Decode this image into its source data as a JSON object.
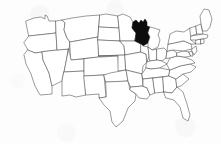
{
  "figure": {
    "width": 221,
    "height": 144,
    "background_color": "#fdfdfd",
    "border_color": "#4a4a4a",
    "state_fill_color": "#ffffff",
    "highlight_color": "#0d0d0d"
  },
  "highlighted": {
    "name": "Wisconsin",
    "abbr": "WI",
    "fill": "#0d0d0d"
  },
  "legend": {
    "visible": false,
    "items": []
  },
  "labels": {
    "visible": false,
    "items": []
  },
  "states": [
    {
      "abbr": "WA",
      "name": "Washington",
      "highlight": false,
      "d": "M26,21 L34,18 L41,17 L45,19 L45,15 L47,16 L49,21 L56,21 L56,33 L29,36 Z"
    },
    {
      "abbr": "OR",
      "name": "Oregon",
      "highlight": false,
      "d": "M29,36 L56,33 L57,50 L35,53 L28,50 L24,43 Z"
    },
    {
      "abbr": "CA",
      "name": "California",
      "highlight": false,
      "d": "M28,50 L35,53 L42,52 L43,60 L49,73 L52,86 L52,94 L40,95 L35,86 L31,74 L26,64 L24,55 Z"
    },
    {
      "abbr": "NV",
      "name": "Nevada",
      "highlight": false,
      "d": "M57,50 L68,49 L67,57 L64,72 L62,81 L52,86 L49,73 L43,60 L42,52 Z"
    },
    {
      "abbr": "ID",
      "name": "Idaho",
      "highlight": false,
      "d": "M56,21 L62,20 L65,23 L64,30 L67,38 L70,42 L69,49 L57,50 L56,33 Z"
    },
    {
      "abbr": "MT",
      "name": "Montana",
      "highlight": false,
      "d": "M62,20 L72,18 L86,16 L100,15 L99,25 L98,37 L70,42 L67,38 L64,30 L65,23 Z"
    },
    {
      "abbr": "WY",
      "name": "Wyoming",
      "highlight": false,
      "d": "M70,42 L98,37 L99,57 L71,60 Z"
    },
    {
      "abbr": "UT",
      "name": "Utah",
      "highlight": false,
      "d": "M69,49 L71,60 L84,59 L84,71 L64,72 L67,57 Z"
    },
    {
      "abbr": "AZ",
      "name": "Arizona",
      "highlight": false,
      "d": "M64,72 L84,71 L86,95 L76,97 L70,95 L62,96 L62,81 Z"
    },
    {
      "abbr": "CO",
      "name": "Colorado",
      "highlight": false,
      "d": "M99,57 L101,57 L118,56 L119,74 L84,76 L84,59 Z"
    },
    {
      "abbr": "NM",
      "name": "New Mexico",
      "highlight": false,
      "d": "M84,76 L104,75 L106,97 L99,98 L99,94 L86,95 Z"
    },
    {
      "abbr": "ND",
      "name": "North Dakota",
      "highlight": false,
      "d": "M100,15 L106,14 L118,16 L119,28 L99,27 Z"
    },
    {
      "abbr": "SD",
      "name": "South Dakota",
      "highlight": false,
      "d": "M99,27 L119,28 L120,41 L98,40 Z"
    },
    {
      "abbr": "NE",
      "name": "Nebraska",
      "highlight": false,
      "d": "M98,40 L120,41 L124,46 L125,55 L99,56 Z"
    },
    {
      "abbr": "KS",
      "name": "Kansas",
      "highlight": false,
      "d": "M99,56 L125,55 L126,70 L118,71 L118,56 Z"
    },
    {
      "abbr": "OK",
      "name": "Oklahoma",
      "highlight": false,
      "d": "M104,75 L110,73 L126,70 L128,81 L113,82 L106,82 Z"
    },
    {
      "abbr": "TX",
      "name": "Texas",
      "highlight": false,
      "d": "M106,82 L128,81 L130,90 L136,94 L135,101 L128,108 L123,121 L116,127 L112,122 L110,111 L104,105 L99,98 L106,97 Z"
    },
    {
      "abbr": "MN",
      "name": "Minnesota",
      "highlight": false,
      "d": "M118,16 L123,14 L130,17 L133,22 L132,28 L136,33 L135,41 L120,41 L119,28 Z"
    },
    {
      "abbr": "IA",
      "name": "Iowa",
      "highlight": false,
      "d": "M120,41 L135,41 L141,44 L141,52 L125,55 L124,46 Z"
    },
    {
      "abbr": "MO",
      "name": "Missouri",
      "highlight": false,
      "d": "M125,55 L141,52 L146,54 L147,62 L143,66 L142,74 L126,70 Z"
    },
    {
      "abbr": "AR",
      "name": "Arkansas",
      "highlight": false,
      "d": "M128,81 L126,70 L142,74 L143,86 L131,87 Z"
    },
    {
      "abbr": "LA",
      "name": "Louisiana",
      "highlight": false,
      "d": "M131,87 L143,86 L147,88 L150,95 L147,99 L139,98 L136,94 L130,90 Z"
    },
    {
      "abbr": "WI",
      "name": "Wisconsin",
      "highlight": true,
      "d": "M136,33 L132,28 L133,22 L136,20 L139,23 L141,20 L143,22 L145,19 L147,22 L147,26 L150,27 L148,33 L150,37 L148,43 L143,46 L141,44 L135,41 Z"
    },
    {
      "abbr": "IL",
      "name": "Illinois",
      "highlight": false,
      "d": "M141,44 L143,46 L148,47 L149,56 L147,62 L146,54 L141,52 Z"
    },
    {
      "abbr": "MI",
      "name": "Michigan",
      "highlight": false,
      "d": "M150,27 L154,28 L160,30 L158,35 L160,40 L158,47 L152,50 L148,47 L148,43 L150,37 L148,33 Z"
    },
    {
      "abbr": "IN",
      "name": "Indiana",
      "highlight": false,
      "d": "M149,56 L148,47 L152,50 L157,49 L157,60 L150,61 Z"
    },
    {
      "abbr": "OH",
      "name": "Ohio",
      "highlight": false,
      "d": "M157,49 L164,48 L167,51 L166,58 L162,61 L157,60 Z"
    },
    {
      "abbr": "KY",
      "name": "Kentucky",
      "highlight": false,
      "d": "M147,62 L150,61 L157,60 L162,61 L167,64 L160,68 L151,69 L146,68 Z"
    },
    {
      "abbr": "TN",
      "name": "Tennessee",
      "highlight": false,
      "d": "M142,74 L146,68 L151,69 L160,68 L170,70 L169,76 L143,79 Z"
    },
    {
      "abbr": "MS",
      "name": "Mississippi",
      "highlight": false,
      "d": "M143,86 L143,79 L153,78 L155,93 L150,95 L147,88 Z"
    },
    {
      "abbr": "AL",
      "name": "Alabama",
      "highlight": false,
      "d": "M153,78 L163,77 L164,92 L155,93 Z"
    },
    {
      "abbr": "GA",
      "name": "Georgia",
      "highlight": false,
      "d": "M163,77 L169,76 L176,79 L177,87 L172,93 L164,92 Z"
    },
    {
      "abbr": "FL",
      "name": "Florida",
      "highlight": false,
      "d": "M164,92 L172,93 L177,87 L183,92 L187,104 L190,115 L188,121 L183,118 L180,107 L174,100 L166,98 Z"
    },
    {
      "abbr": "SC",
      "name": "South Carolina",
      "highlight": false,
      "d": "M176,79 L183,74 L189,79 L181,86 L177,87 Z"
    },
    {
      "abbr": "NC",
      "name": "North Carolina",
      "highlight": false,
      "d": "M170,70 L180,66 L190,64 L196,67 L191,72 L183,74 L176,79 L169,76 Z"
    },
    {
      "abbr": "VA",
      "name": "Virginia",
      "highlight": false,
      "d": "M167,64 L170,58 L177,56 L184,57 L192,60 L195,63 L190,64 L180,66 L170,70 Z"
    },
    {
      "abbr": "WV",
      "name": "West Virginia",
      "highlight": false,
      "d": "M166,58 L167,51 L173,50 L177,53 L177,56 L170,58 Z"
    },
    {
      "abbr": "MD",
      "name": "Maryland",
      "highlight": false,
      "d": "M177,53 L183,51 L189,52 L191,56 L186,57 L184,57 L177,56 Z"
    },
    {
      "abbr": "DE",
      "name": "Delaware",
      "highlight": false,
      "d": "M189,52 L192,51 L193,56 L191,56 Z"
    },
    {
      "abbr": "PA",
      "name": "Pennsylvania",
      "highlight": false,
      "d": "M167,51 L168,44 L184,41 L191,44 L192,49 L183,51 L173,50 Z"
    },
    {
      "abbr": "NJ",
      "name": "New Jersey",
      "highlight": false,
      "d": "M192,49 L196,46 L197,51 L194,55 L192,51 Z"
    },
    {
      "abbr": "NY",
      "name": "New York",
      "highlight": false,
      "d": "M168,44 L170,34 L176,31 L184,32 L190,28 L193,32 L191,40 L196,44 L191,44 L184,41 Z"
    },
    {
      "abbr": "CT",
      "name": "Connecticut",
      "highlight": false,
      "d": "M196,40 L201,39 L201,44 L196,44 Z"
    },
    {
      "abbr": "RI",
      "name": "Rhode Island",
      "highlight": false,
      "d": "M201,39 L204,39 L204,43 L201,44 Z"
    },
    {
      "abbr": "MA",
      "name": "Massachusetts",
      "highlight": false,
      "d": "M191,36 L203,34 L208,35 L207,38 L201,39 L196,40 L191,40 Z"
    },
    {
      "abbr": "VT",
      "name": "Vermont",
      "highlight": false,
      "d": "M190,28 L196,26 L197,34 L191,36 Z"
    },
    {
      "abbr": "NH",
      "name": "New Hampshire",
      "highlight": false,
      "d": "M196,26 L201,24 L203,34 L197,34 Z"
    },
    {
      "abbr": "ME",
      "name": "Maine",
      "highlight": false,
      "d": "M201,24 L200,16 L204,9 L209,10 L212,19 L210,27 L207,31 L203,31 Z"
    }
  ]
}
